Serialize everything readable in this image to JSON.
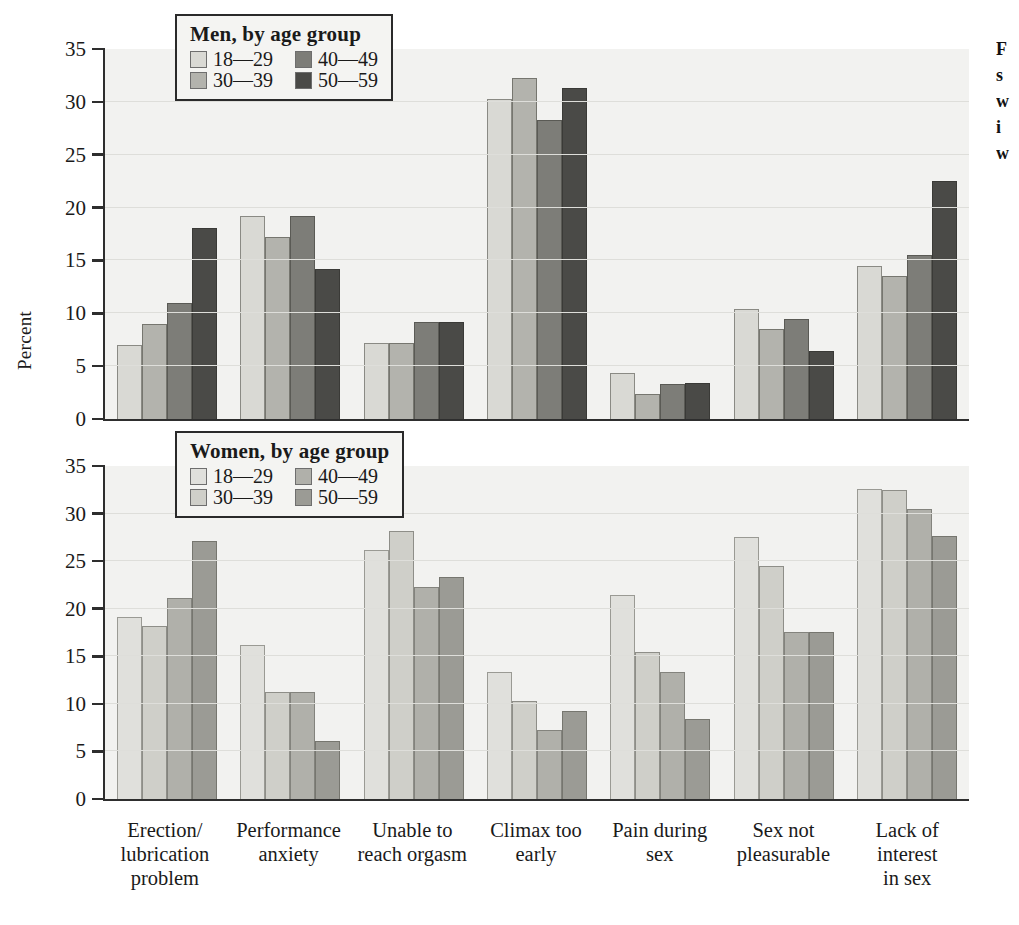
{
  "figure": {
    "ylabel": "Percent",
    "margin_bleed": [
      "F",
      "s",
      "w",
      "i",
      "w"
    ]
  },
  "legends": {
    "men": {
      "title": "Men, by age group",
      "items": [
        {
          "label": "18—29",
          "color": "#d9d9d4"
        },
        {
          "label": "40—49",
          "color": "#7d7d78"
        },
        {
          "label": "30—39",
          "color": "#b3b3ad"
        },
        {
          "label": "50—59",
          "color": "#4a4a47"
        }
      ]
    },
    "women": {
      "title": "Women, by age group",
      "items": [
        {
          "label": "18—29",
          "color": "#e0e0dc"
        },
        {
          "label": "40—49",
          "color": "#b0b0aa"
        },
        {
          "label": "30—39",
          "color": "#cfcfc9"
        },
        {
          "label": "50—59",
          "color": "#9b9b95"
        }
      ]
    }
  },
  "axis": {
    "yticks": [
      0,
      5,
      10,
      15,
      20,
      25,
      30,
      35
    ],
    "yticklabels": [
      "0",
      "5",
      "10",
      "15",
      "20",
      "25",
      "30",
      "35"
    ]
  },
  "categories": [
    {
      "lines": [
        "Erection/",
        "lubrication",
        "problem"
      ]
    },
    {
      "lines": [
        "Performance",
        "anxiety"
      ]
    },
    {
      "lines": [
        "Unable to",
        "reach orgasm"
      ]
    },
    {
      "lines": [
        "Climax too",
        "early"
      ]
    },
    {
      "lines": [
        "Pain during",
        "sex"
      ]
    },
    {
      "lines": [
        "Sex not",
        "pleasurable"
      ]
    },
    {
      "lines": [
        "Lack of interest",
        "in sex"
      ]
    }
  ],
  "chart_data": [
    {
      "type": "bar",
      "title": "Men, by age group",
      "xlabel": "",
      "ylabel": "Percent",
      "ylim": [
        0,
        35
      ],
      "yticks": [
        0,
        5,
        10,
        15,
        20,
        25,
        30,
        35
      ],
      "grid": true,
      "legend_position": "top-left inside",
      "categories": [
        "Erection/ lubrication problem",
        "Performance anxiety",
        "Unable to reach orgasm",
        "Climax too early",
        "Pain during sex",
        "Sex not pleasurable",
        "Lack of interest in sex"
      ],
      "series": [
        {
          "name": "18—29",
          "values": [
            7.0,
            19.2,
            7.2,
            30.3,
            4.4,
            10.4,
            14.5
          ]
        },
        {
          "name": "30—39",
          "values": [
            9.0,
            17.2,
            7.2,
            32.3,
            2.4,
            8.5,
            13.5
          ]
        },
        {
          "name": "40—49",
          "values": [
            11.0,
            19.2,
            9.2,
            28.3,
            3.3,
            9.5,
            15.5
          ]
        },
        {
          "name": "50—59",
          "values": [
            18.1,
            14.2,
            9.2,
            31.3,
            3.4,
            6.4,
            22.5
          ]
        }
      ]
    },
    {
      "type": "bar",
      "title": "Women, by age group",
      "xlabel": "",
      "ylabel": "Percent",
      "ylim": [
        0,
        35
      ],
      "yticks": [
        0,
        5,
        10,
        15,
        20,
        25,
        30,
        35
      ],
      "grid": true,
      "legend_position": "top-left inside",
      "categories": [
        "Erection/ lubrication problem",
        "Performance anxiety",
        "Unable to reach orgasm",
        "Climax too early",
        "Pain during sex",
        "Sex not pleasurable",
        "Lack of interest in sex"
      ],
      "series": [
        {
          "name": "18—29",
          "values": [
            19.1,
            16.2,
            26.2,
            13.3,
            21.4,
            27.5,
            32.6
          ]
        },
        {
          "name": "30—39",
          "values": [
            18.2,
            11.2,
            28.2,
            10.3,
            15.4,
            24.5,
            32.5
          ]
        },
        {
          "name": "40—49",
          "values": [
            21.1,
            11.2,
            22.3,
            7.3,
            13.4,
            17.6,
            30.5
          ]
        },
        {
          "name": "50—59",
          "values": [
            27.1,
            6.1,
            23.3,
            9.3,
            8.4,
            17.6,
            27.6
          ]
        }
      ]
    }
  ]
}
